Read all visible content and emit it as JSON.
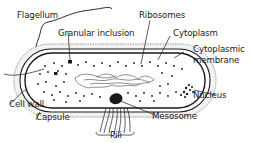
{
  "diagram": {
    "labels": {
      "flagellum": "Flagellum",
      "granular_inclusion": "Granular inclusion",
      "ribosomes": "Ribosomes",
      "cytoplasm": "Cytoplasm",
      "cytoplasmic_membrane_line1": "Cytoplasmic",
      "cytoplasmic_membrane_line2": "membrane",
      "nucleus": "Nucleus",
      "cell_wall": "Cell wall",
      "capsule": "Capsule",
      "mesosome": "Mesosome",
      "pili": "Pili"
    },
    "colors": {
      "ink": "#1a1a1a",
      "background": "#ffffff",
      "capsule_fill": "#f2f2f2"
    }
  }
}
